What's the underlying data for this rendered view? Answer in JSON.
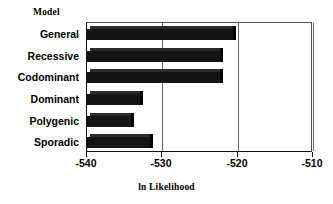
{
  "chart_data": {
    "type": "bar",
    "orientation": "horizontal",
    "title": "",
    "categories": [
      "General",
      "Recessive",
      "Codominant",
      "Dominant",
      "Polygenic",
      "Sporadic"
    ],
    "values": [
      -520.6,
      -522.4,
      -522.3,
      -533.0,
      -534.2,
      -531.6
    ],
    "series": [
      {
        "name": "ln Likelihood",
        "values": [
          -520.6,
          -522.4,
          -522.3,
          -533.0,
          -534.2,
          -531.6
        ]
      }
    ],
    "xlabel": "ln Likelihood",
    "ylabel": "Model",
    "xlim": [
      -540,
      -510
    ],
    "xticks": [
      -540,
      -530,
      -520,
      -510
    ],
    "xtick_labels": [
      "-540",
      "-530",
      "-520",
      "-510"
    ],
    "grid": true,
    "gridlines_at": [
      -530,
      -520,
      -510
    ],
    "legend": null,
    "bar_color": "#141414",
    "bar_shadow_color": "#000000",
    "axis_color": "#111111",
    "background_color": "#ffffff"
  },
  "labels": {
    "category_axis_title": "Model",
    "value_axis_title": "ln Likelihood"
  }
}
